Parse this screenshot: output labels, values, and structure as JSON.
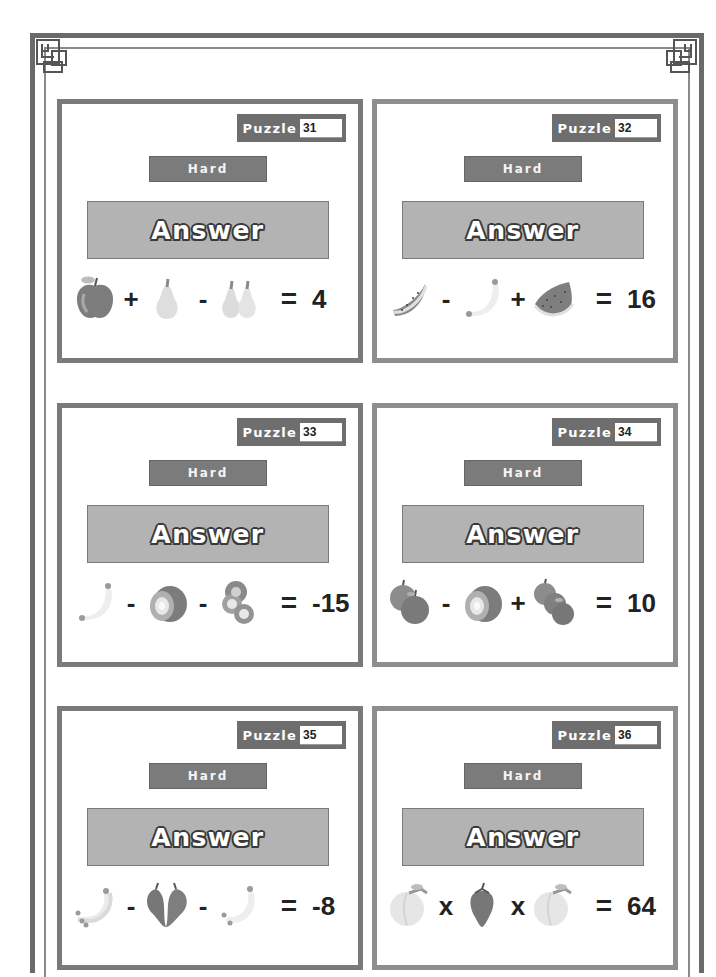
{
  "page": {
    "cards": [
      {
        "puzzle_label": "Puzzle",
        "puzzle_number": "31",
        "difficulty": "Hard",
        "answer_label": "Answer",
        "terms": [
          {
            "fruit": "apple-icon"
          },
          {
            "op": "+"
          },
          {
            "fruit": "pear-icon"
          },
          {
            "op": "-"
          },
          {
            "fruit": "two-pears-icon"
          }
        ],
        "equals": "=",
        "result": "4"
      },
      {
        "puzzle_label": "Puzzle",
        "puzzle_number": "32",
        "difficulty": "Hard",
        "answer_label": "Answer",
        "terms": [
          {
            "fruit": "watermelon-slice-icon"
          },
          {
            "op": "-"
          },
          {
            "fruit": "banana-icon"
          },
          {
            "op": "+"
          },
          {
            "fruit": "watermelon-slices-icon"
          }
        ],
        "equals": "=",
        "result": "16"
      },
      {
        "puzzle_label": "Puzzle",
        "puzzle_number": "33",
        "difficulty": "Hard",
        "answer_label": "Answer",
        "terms": [
          {
            "fruit": "banana-icon"
          },
          {
            "op": "-"
          },
          {
            "fruit": "kiwi-icon"
          },
          {
            "op": "-"
          },
          {
            "fruit": "kiwi-slices-icon"
          }
        ],
        "equals": "=",
        "result": "-15"
      },
      {
        "puzzle_label": "Puzzle",
        "puzzle_number": "34",
        "difficulty": "Hard",
        "answer_label": "Answer",
        "terms": [
          {
            "fruit": "two-apples-icon"
          },
          {
            "op": "-"
          },
          {
            "fruit": "kiwi-icon"
          },
          {
            "op": "+"
          },
          {
            "fruit": "three-apples-icon"
          }
        ],
        "equals": "=",
        "result": "10"
      },
      {
        "puzzle_label": "Puzzle",
        "puzzle_number": "35",
        "difficulty": "Hard",
        "answer_label": "Answer",
        "terms": [
          {
            "fruit": "banana-bunch-icon"
          },
          {
            "op": "-"
          },
          {
            "fruit": "two-strawberries-icon"
          },
          {
            "op": "-"
          },
          {
            "fruit": "bananas-icon"
          }
        ],
        "equals": "=",
        "result": "-8"
      },
      {
        "puzzle_label": "Puzzle",
        "puzzle_number": "36",
        "difficulty": "Hard",
        "answer_label": "Answer",
        "terms": [
          {
            "fruit": "peach-icon"
          },
          {
            "op": "x"
          },
          {
            "fruit": "strawberry-icon"
          },
          {
            "op": "x"
          },
          {
            "fruit": "peach-icon"
          }
        ],
        "equals": "=",
        "result": "64"
      }
    ]
  },
  "colors": {
    "frame": "#6a6a6a",
    "card_border": "#7a7a7a",
    "tag_bg": "#6e6e6e",
    "answer_bg": "#b3b3b3"
  }
}
